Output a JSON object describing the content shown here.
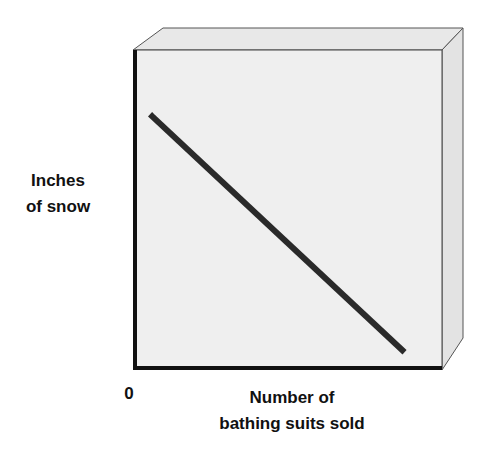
{
  "chart_data": {
    "type": "line",
    "title": "",
    "xlabel": "Number of bathing suits sold",
    "xlabel_lines": [
      "Number of",
      "bathing suits sold"
    ],
    "ylabel": "Inches of snow",
    "ylabel_lines": [
      "Inches",
      "of snow"
    ],
    "origin_label": "0",
    "x_ticks": [],
    "y_ticks": [],
    "grid": false,
    "legend": null,
    "style": "3d-box",
    "series": [
      {
        "name": "relationship",
        "description": "negative linear correlation",
        "x": [
          0.05,
          0.87
        ],
        "y": [
          0.79,
          0.05
        ]
      }
    ],
    "xlim": [
      0,
      1
    ],
    "ylim": [
      0,
      1
    ],
    "colors": {
      "panel": "#efefef",
      "side": "#e3e3e3",
      "top": "#e8e8e8",
      "axis": "#111111",
      "line": "#2a2a2a"
    }
  }
}
